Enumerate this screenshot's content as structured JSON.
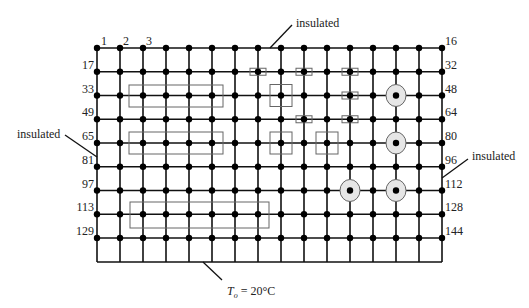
{
  "diagram": {
    "grid": {
      "columns": 16,
      "rows": 9,
      "x0": 97,
      "dx": 23,
      "y0": 48,
      "dy": 23.75,
      "bottom_y": 262,
      "line_color": "#111111",
      "node_color": "#000000"
    },
    "top_node_labels": [
      {
        "text": "1",
        "x": 101,
        "y": 45
      },
      {
        "text": "2",
        "x": 123,
        "y": 45
      },
      {
        "text": "3",
        "x": 146,
        "y": 45
      }
    ],
    "left_labels": [
      {
        "text": "17",
        "row": 1
      },
      {
        "text": "33",
        "row": 2
      },
      {
        "text": "49",
        "row": 3
      },
      {
        "text": "65",
        "row": 4
      },
      {
        "text": "81",
        "row": 5
      },
      {
        "text": "97",
        "row": 6
      },
      {
        "text": "113",
        "row": 7
      },
      {
        "text": "129",
        "row": 8
      }
    ],
    "right_labels": [
      {
        "text": "16",
        "row": 0
      },
      {
        "text": "32",
        "row": 1
      },
      {
        "text": "48",
        "row": 2
      },
      {
        "text": "64",
        "row": 3
      },
      {
        "text": "80",
        "row": 4
      },
      {
        "text": "96",
        "row": 5
      },
      {
        "text": "112",
        "row": 6
      },
      {
        "text": "128",
        "row": 7
      },
      {
        "text": "144",
        "row": 8
      }
    ],
    "boundary_labels": {
      "top": "insulated",
      "left": "insulated",
      "right": "insulated",
      "bottom_prefix": "T",
      "bottom_sub": "o",
      "bottom_suffix": " = 20°C"
    },
    "large_rectangles": [
      {
        "x": 129,
        "y": 85,
        "w": 94,
        "h": 22
      },
      {
        "x": 129,
        "y": 132,
        "w": 94,
        "h": 22
      },
      {
        "x": 130,
        "y": 202,
        "w": 139,
        "h": 26
      }
    ],
    "small_rectangles": [
      {
        "col": 7,
        "row": 1
      },
      {
        "col": 9,
        "row": 1
      },
      {
        "col": 11,
        "row": 1
      },
      {
        "col": 11,
        "row": 2
      },
      {
        "col": 9,
        "row": 3
      },
      {
        "col": 11,
        "row": 3
      }
    ],
    "squares": [
      {
        "col": 8,
        "row": 2
      },
      {
        "col": 8,
        "row": 4
      },
      {
        "col": 10,
        "row": 4
      }
    ],
    "circles": [
      {
        "col": 13,
        "row": 2
      },
      {
        "col": 13,
        "row": 4
      },
      {
        "col": 11,
        "row": 6
      },
      {
        "col": 13,
        "row": 6
      }
    ],
    "circle_fill": "#e6e6e6",
    "marker_stroke": "#666666"
  }
}
